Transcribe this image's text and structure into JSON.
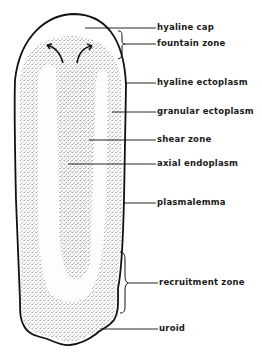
{
  "diagram": {
    "labels": [
      {
        "id": "hyaline-cap",
        "text": "hyaline cap",
        "x": 157,
        "y": 22,
        "line_from_x": 85,
        "line_y": 28
      },
      {
        "id": "fountain-zone",
        "text": "fountain zone",
        "x": 157,
        "y": 38,
        "line_from_x": 124,
        "line_y": 44
      },
      {
        "id": "hyaline-ectoplasm",
        "text": "hyaline  ectoplasm",
        "x": 157,
        "y": 77,
        "line_from_x": 128,
        "line_y": 83
      },
      {
        "id": "granular-ectoplasm",
        "text": "granular ectoplasm",
        "x": 157,
        "y": 106,
        "line_from_x": 112,
        "line_y": 112
      },
      {
        "id": "shear-zone",
        "text": "shear zone",
        "x": 157,
        "y": 134,
        "line_from_x": 89,
        "line_y": 140
      },
      {
        "id": "axial-endoplasm",
        "text": "axial endoplasm",
        "x": 157,
        "y": 158,
        "line_from_x": 68,
        "line_y": 164
      },
      {
        "id": "plasmalemma",
        "text": "plasmalemma",
        "x": 157,
        "y": 197,
        "line_from_x": 124,
        "line_y": 203
      },
      {
        "id": "recruitment-zone",
        "text": "recruitment zone",
        "x": 159,
        "y": 277,
        "line_from_x": 126,
        "line_y": 283
      },
      {
        "id": "uroid",
        "text": "uroid",
        "x": 159,
        "y": 323,
        "line_from_x": 101,
        "line_y": 329
      }
    ],
    "colors": {
      "outline": "#111111",
      "stipple": "#333333",
      "background": "#ffffff",
      "text": "#1a1a1a"
    }
  }
}
